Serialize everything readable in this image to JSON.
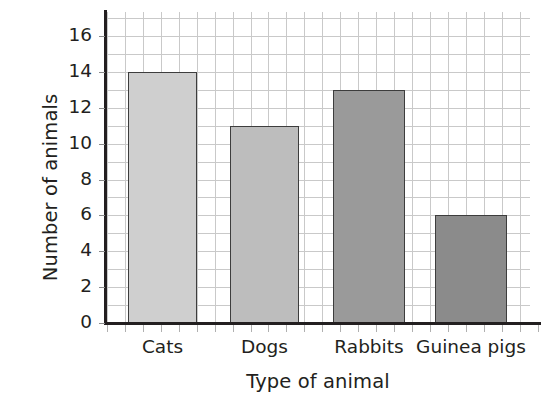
{
  "chart_data": {
    "type": "bar",
    "title": "",
    "subtitle": "",
    "xlabel": "Type of animal",
    "ylabel": "Number of animals",
    "categories": [
      "Cats",
      "Dogs",
      "Rabbits",
      "Guinea pigs"
    ],
    "values": [
      14,
      11,
      13,
      6
    ],
    "ylim": [
      0,
      16
    ],
    "ytick_step": 2,
    "ytick_labels": [
      "0",
      "2",
      "4",
      "6",
      "8",
      "10",
      "12",
      "14",
      "16"
    ],
    "grid": true,
    "grid_style": "light grey square grid behind plot",
    "legend": "none",
    "bar_colors": [
      "#cfcfcf",
      "#bdbdbd",
      "#9a9a9a",
      "#8b8b8b"
    ],
    "bar_border_color": "#3d3d3d",
    "axis_color": "#231f20",
    "background_color": "#ffffff"
  }
}
